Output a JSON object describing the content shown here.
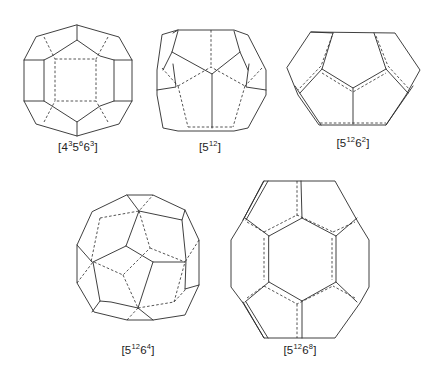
{
  "figure": {
    "cages": [
      {
        "id": "c1",
        "label_base": "[4",
        "parts": [
          {
            "b": "4",
            "s": "3"
          },
          {
            "b": "5",
            "s": "6"
          },
          {
            "b": "6",
            "s": "3"
          }
        ],
        "label_text": "[4³5⁶6³]",
        "faces": {
          "square": 3,
          "pentagon": 6,
          "hexagon": 3
        }
      },
      {
        "id": "c2",
        "parts": [
          {
            "b": "5",
            "s": "12"
          }
        ],
        "label_text": "[5¹²]",
        "faces": {
          "pentagon": 12
        }
      },
      {
        "id": "c3",
        "parts": [
          {
            "b": "5",
            "s": "12"
          },
          {
            "b": "6",
            "s": "2"
          }
        ],
        "label_text": "[5¹²6²]",
        "faces": {
          "pentagon": 12,
          "hexagon": 2
        }
      },
      {
        "id": "c4",
        "parts": [
          {
            "b": "5",
            "s": "12"
          },
          {
            "b": "6",
            "s": "4"
          }
        ],
        "label_text": "[5¹²6⁴]",
        "faces": {
          "pentagon": 12,
          "hexagon": 4
        }
      },
      {
        "id": "c5",
        "parts": [
          {
            "b": "5",
            "s": "12"
          },
          {
            "b": "6",
            "s": "8"
          }
        ],
        "label_text": "[5¹²6⁸]",
        "faces": {
          "pentagon": 12,
          "hexagon": 8
        }
      }
    ]
  },
  "labels": {
    "c1": {
      "open": "[",
      "b1": "4",
      "s1": "3",
      "b2": "5",
      "s2": "6",
      "b3": "6",
      "s3": "3",
      "close": "]"
    },
    "c2": {
      "open": "[",
      "b1": "5",
      "s1": "12",
      "close": "]"
    },
    "c3": {
      "open": "[",
      "b1": "5",
      "s1": "12",
      "b2": "6",
      "s2": "2",
      "close": "]"
    },
    "c4": {
      "open": "[",
      "b1": "5",
      "s1": "12",
      "b2": "6",
      "s2": "4",
      "close": "]"
    },
    "c5": {
      "open": "[",
      "b1": "5",
      "s1": "12",
      "b2": "6",
      "s2": "8",
      "close": "]"
    }
  },
  "colors": {
    "line": "#2a2a2a",
    "background": "#ffffff"
  }
}
